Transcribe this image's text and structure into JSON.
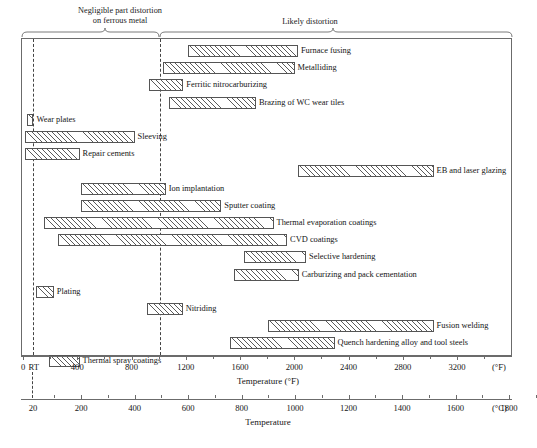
{
  "chart_data": {
    "type": "bar",
    "orientation": "horizontal-range",
    "title": "",
    "xlabel": "Temperature (°F)",
    "xlabel_secondary": "Temperature",
    "unit_primary": "(°F)",
    "unit_secondary": "(°C)",
    "xlim_f": [
      0,
      3500
    ],
    "xticks_f": [
      0,
      400,
      800,
      1200,
      1600,
      2000,
      2400,
      2800,
      3200
    ],
    "xticklabels_f": [
      "0",
      "400",
      "800",
      "1200",
      "1600",
      "2000",
      "2400",
      "2800",
      "3200"
    ],
    "xtick_rt_label": "RT",
    "xtick_rt_value_f": 70,
    "xticks_c": [
      20,
      200,
      400,
      600,
      800,
      1000,
      1200,
      1400,
      1600,
      1800
    ],
    "xticklabels_c": [
      "20",
      "200",
      "400",
      "600",
      "800",
      "1000",
      "1200",
      "1400",
      "1600",
      "1800"
    ],
    "grid": false,
    "legend": "none",
    "annotations": [
      {
        "name": "negligible-distortion",
        "text": "Negligible part distortion\non ferrous metal",
        "span_f": [
          70,
          1000
        ]
      },
      {
        "name": "likely-distortion",
        "text": "Likely distortion",
        "span_f": [
          1000,
          3650
        ]
      }
    ],
    "divider_lines_f": [
      70,
      1000
    ],
    "categories": [
      "Furnace fusing",
      "Metalliding",
      "Ferritic nitrocarburizing",
      "Brazing of WC wear tiles",
      "Wear plates",
      "Sleeving",
      "Repair cements",
      "EB and laser glazing",
      "Ion implantation",
      "Sputter coating",
      "Thermal evaporation coatings",
      "CVD coatings",
      "Selective hardening",
      "Carburizing and pack cementation",
      "Plating",
      "Nitriding",
      "Fusion welding",
      "Quench hardening alloy and tool steels",
      "Thermal spray coatings"
    ],
    "bars": [
      {
        "label": "Furnace fusing",
        "start_f": 1210,
        "end_f": 2020
      },
      {
        "label": "Metalliding",
        "start_f": 1025,
        "end_f": 1995
      },
      {
        "label": "Ferritic nitrocarburizing",
        "start_f": 920,
        "end_f": 1175
      },
      {
        "label": "Brazing of WC wear tiles",
        "start_f": 1070,
        "end_f": 1710
      },
      {
        "label": "Wear plates",
        "start_f": 25,
        "end_f": 70
      },
      {
        "label": "Sleeving",
        "start_f": 10,
        "end_f": 815
      },
      {
        "label": "Repair cements",
        "start_f": 10,
        "end_f": 410
      },
      {
        "label": "EB and laser glazing",
        "start_f": 2020,
        "end_f": 3020
      },
      {
        "label": "Ion implantation",
        "start_f": 420,
        "end_f": 1045
      },
      {
        "label": "Sputter coating",
        "start_f": 420,
        "end_f": 1455
      },
      {
        "label": "Thermal evaporation coatings",
        "start_f": 150,
        "end_f": 1840
      },
      {
        "label": "CVD coatings",
        "start_f": 250,
        "end_f": 1940
      },
      {
        "label": "Selective hardening",
        "start_f": 1620,
        "end_f": 2080
      },
      {
        "label": "Carburizing and pack cementation",
        "start_f": 1545,
        "end_f": 2025
      },
      {
        "label": "Plating",
        "start_f": 90,
        "end_f": 220
      },
      {
        "label": "Nitriding",
        "start_f": 910,
        "end_f": 1170
      },
      {
        "label": "Fusion welding",
        "start_f": 1800,
        "end_f": 3020
      },
      {
        "label": "Quench hardening alloy and tool steels",
        "start_f": 1520,
        "end_f": 2290
      },
      {
        "label": "Thermal spray coatings",
        "start_f": 185,
        "end_f": 410
      }
    ]
  },
  "colors": {
    "frame": "#6b6b6b",
    "bar_border": "#555555",
    "hatch": "#5a5a5a",
    "text": "#141414",
    "background": "#ffffff"
  }
}
